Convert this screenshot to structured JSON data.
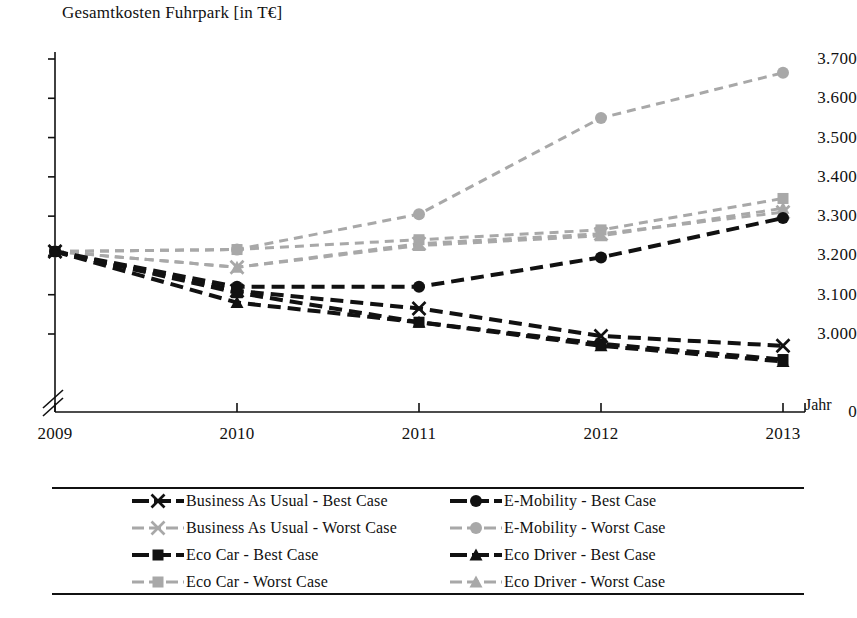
{
  "chart_data": {
    "type": "line",
    "title": "Gesamtkosten Fuhrpark [in T€]",
    "xlabel": "Jahr",
    "ylabel": "",
    "categories": [
      "2009",
      "2010",
      "2011",
      "2012",
      "2013"
    ],
    "x": [
      2009,
      2010,
      2011,
      2012,
      2013
    ],
    "ylim": [
      2950,
      3700
    ],
    "yticks": [
      "0",
      "3.000",
      "3.100",
      "3.200",
      "3.300",
      "3.400",
      "3.500",
      "3.600",
      "3.700"
    ],
    "ytick_values": [
      0,
      3000,
      3100,
      3200,
      3300,
      3400,
      3500,
      3600,
      3700
    ],
    "axis_break": true,
    "grid": false,
    "legend_position": "bottom",
    "series": [
      {
        "name": "Business As Usual - Best Case",
        "marker": "x",
        "color": "#111111",
        "values": [
          3210,
          3110,
          3065,
          2995,
          2970
        ]
      },
      {
        "name": "Business As Usual - Worst Case",
        "marker": "x",
        "color": "#a8a8a8",
        "values": [
          3210,
          3170,
          3230,
          3255,
          3310
        ]
      },
      {
        "name": "Eco Car - Best Case",
        "marker": "square",
        "color": "#111111",
        "values": [
          3210,
          3105,
          3030,
          2975,
          2935
        ]
      },
      {
        "name": "Eco Car - Worst Case",
        "marker": "square",
        "color": "#a8a8a8",
        "values": [
          3210,
          3215,
          3240,
          3265,
          3345
        ]
      },
      {
        "name": "E-Mobility - Best Case",
        "marker": "circle",
        "color": "#111111",
        "values": [
          3210,
          3120,
          3120,
          3195,
          3295
        ]
      },
      {
        "name": "E-Mobility - Worst Case",
        "marker": "circle",
        "color": "#a8a8a8",
        "values": [
          3210,
          3215,
          3305,
          3550,
          3665
        ]
      },
      {
        "name": "Eco Driver - Best Case",
        "marker": "triangle",
        "color": "#111111",
        "values": [
          3210,
          3080,
          3030,
          2970,
          2930
        ]
      },
      {
        "name": "Eco Driver - Worst Case",
        "marker": "triangle",
        "color": "#a8a8a8",
        "values": [
          3210,
          3170,
          3225,
          3250,
          3320
        ]
      }
    ]
  },
  "legend": {
    "items": [
      {
        "label": "Business As Usual - Best Case",
        "marker": "x",
        "color": "#111111"
      },
      {
        "label": "E-Mobility - Best Case",
        "marker": "circle",
        "color": "#111111"
      },
      {
        "label": "Business As Usual - Worst Case",
        "marker": "x",
        "color": "#a8a8a8"
      },
      {
        "label": "E-Mobility - Worst Case",
        "marker": "circle",
        "color": "#a8a8a8"
      },
      {
        "label": "Eco Car - Best Case",
        "marker": "square",
        "color": "#111111"
      },
      {
        "label": "Eco Driver - Best Case",
        "marker": "triangle",
        "color": "#111111"
      },
      {
        "label": "Eco Car - Worst Case",
        "marker": "square",
        "color": "#a8a8a8"
      },
      {
        "label": "Eco Driver - Worst Case",
        "marker": "triangle",
        "color": "#a8a8a8"
      }
    ]
  },
  "caption": ""
}
